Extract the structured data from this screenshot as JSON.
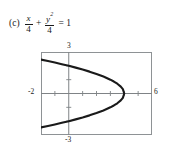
{
  "problem": {
    "part_label": "(c)",
    "equation": {
      "term1": {
        "numerator": "x",
        "denominator": "4"
      },
      "operator": "+",
      "term2": {
        "numerator": "y",
        "exponent": "2",
        "denominator": "4"
      },
      "equals": "=",
      "right_side": "1"
    },
    "equation_plain": "(c) x/4 + y^2/4 = 1"
  },
  "chart_data": {
    "type": "line",
    "title": "",
    "xlabel": "",
    "ylabel": "",
    "xlim": [
      -2,
      6
    ],
    "ylim": [
      -3,
      3
    ],
    "grid": false,
    "legend": null,
    "x_tick_labels": [
      "-2",
      "6"
    ],
    "y_tick_labels": [
      "3",
      "-3"
    ],
    "x_ticks": [
      -1,
      0,
      1,
      2,
      3,
      4,
      5
    ],
    "y_ticks": [
      -2,
      -1,
      1,
      2
    ],
    "curve_color": "#1a1a1a",
    "axis_color": "#7f8386",
    "frame_color": "#8e9295",
    "series": [
      {
        "name": "x = 4 - y^2",
        "points": [
          [
            -2.0,
            2.449
          ],
          [
            -1.5,
            2.345
          ],
          [
            -1.0,
            2.236
          ],
          [
            -0.5,
            2.121
          ],
          [
            0.0,
            2.0
          ],
          [
            0.5,
            1.871
          ],
          [
            1.0,
            1.732
          ],
          [
            1.5,
            1.581
          ],
          [
            2.0,
            1.414
          ],
          [
            2.5,
            1.225
          ],
          [
            3.0,
            1.0
          ],
          [
            3.25,
            0.866
          ],
          [
            3.5,
            0.707
          ],
          [
            3.75,
            0.5
          ],
          [
            3.9,
            0.316
          ],
          [
            4.0,
            0.0
          ],
          [
            3.9,
            -0.316
          ],
          [
            3.75,
            -0.5
          ],
          [
            3.5,
            -0.707
          ],
          [
            3.25,
            -0.866
          ],
          [
            3.0,
            -1.0
          ],
          [
            2.5,
            -1.225
          ],
          [
            2.0,
            -1.414
          ],
          [
            1.5,
            -1.581
          ],
          [
            1.0,
            -1.732
          ],
          [
            0.5,
            -1.871
          ],
          [
            0.0,
            -2.0
          ],
          [
            -0.5,
            -2.121
          ],
          [
            -1.0,
            -2.236
          ],
          [
            -1.5,
            -2.345
          ],
          [
            -2.0,
            -2.449
          ]
        ]
      }
    ]
  }
}
